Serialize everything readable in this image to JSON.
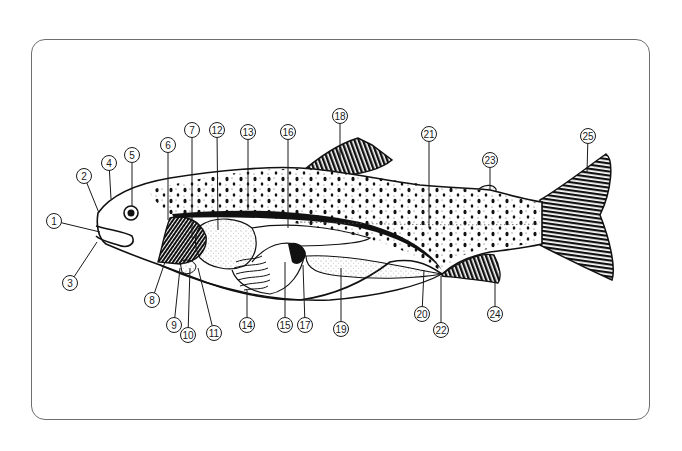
{
  "diagram": {
    "frame": {
      "border_color": "#6e6e6e",
      "background": "#ffffff"
    },
    "labels": [
      {
        "n": "1",
        "x": 54,
        "y": 221,
        "tx": 100,
        "ty": 232
      },
      {
        "n": "2",
        "x": 84,
        "y": 176,
        "tx": 99,
        "ty": 213
      },
      {
        "n": "3",
        "x": 70,
        "y": 283,
        "tx": 97,
        "ty": 242
      },
      {
        "n": "4",
        "x": 109,
        "y": 163,
        "tx": 111,
        "ty": 199
      },
      {
        "n": "5",
        "x": 132,
        "y": 155,
        "tx": 132,
        "ty": 206
      },
      {
        "n": "6",
        "x": 168,
        "y": 145,
        "tx": 168,
        "ty": 220
      },
      {
        "n": "7",
        "x": 192,
        "y": 130,
        "tx": 192,
        "ty": 238
      },
      {
        "n": "8",
        "x": 152,
        "y": 300,
        "tx": 165,
        "ty": 262
      },
      {
        "n": "9",
        "x": 174,
        "y": 325,
        "tx": 180,
        "ty": 268
      },
      {
        "n": "10",
        "x": 188,
        "y": 335,
        "tx": 190,
        "ty": 268
      },
      {
        "n": "11",
        "x": 214,
        "y": 333,
        "tx": 198,
        "ty": 268
      },
      {
        "n": "12",
        "x": 217,
        "y": 130,
        "tx": 218,
        "ty": 230
      },
      {
        "n": "13",
        "x": 248,
        "y": 132,
        "tx": 248,
        "ty": 210
      },
      {
        "n": "14",
        "x": 247,
        "y": 325,
        "tx": 247,
        "ty": 290
      },
      {
        "n": "15",
        "x": 285,
        "y": 325,
        "tx": 285,
        "ty": 262
      },
      {
        "n": "16",
        "x": 288,
        "y": 132,
        "tx": 288,
        "ty": 228
      },
      {
        "n": "17",
        "x": 305,
        "y": 325,
        "tx": 303,
        "ty": 265
      },
      {
        "n": "18",
        "x": 340,
        "y": 116,
        "tx": 340,
        "ty": 160
      },
      {
        "n": "19",
        "x": 341,
        "y": 329,
        "tx": 341,
        "ty": 268
      },
      {
        "n": "20",
        "x": 422,
        "y": 314,
        "tx": 424,
        "ty": 270
      },
      {
        "n": "21",
        "x": 429,
        "y": 134,
        "tx": 429,
        "ty": 228
      },
      {
        "n": "22",
        "x": 441,
        "y": 330,
        "tx": 441,
        "ty": 276
      },
      {
        "n": "23",
        "x": 490,
        "y": 160,
        "tx": 490,
        "ty": 190
      },
      {
        "n": "24",
        "x": 495,
        "y": 314,
        "tx": 495,
        "ty": 280
      },
      {
        "n": "25",
        "x": 588,
        "y": 136,
        "tx": 587,
        "ty": 172
      }
    ]
  }
}
